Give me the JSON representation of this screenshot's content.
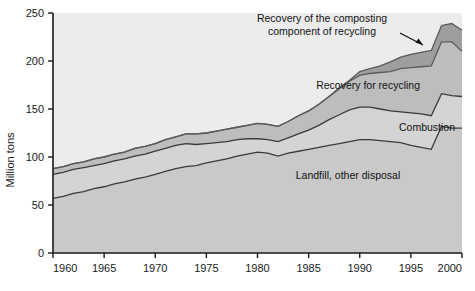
{
  "chart_data": {
    "type": "area",
    "title": "",
    "subtitle": "",
    "xlabel": "",
    "ylabel": "Million tons",
    "xlim": [
      1960,
      2000
    ],
    "ylim": [
      0,
      250
    ],
    "grid": false,
    "legend_position": "inline-annotations",
    "stacked": true,
    "x": [
      1960,
      1961,
      1962,
      1963,
      1964,
      1965,
      1966,
      1967,
      1968,
      1969,
      1970,
      1971,
      1972,
      1973,
      1974,
      1975,
      1976,
      1977,
      1978,
      1979,
      1980,
      1981,
      1982,
      1983,
      1984,
      1985,
      1986,
      1987,
      1988,
      1989,
      1990,
      1991,
      1992,
      1993,
      1994,
      1995,
      1996,
      1997,
      1998,
      1999,
      2000
    ],
    "xticks": [
      1960,
      1965,
      1970,
      1975,
      1980,
      1985,
      1990,
      1995,
      2000
    ],
    "xticklabels": [
      "1960",
      "1965",
      "1970",
      "1975",
      "1980",
      "1985",
      "1990",
      "1995",
      "2000"
    ],
    "yticks": [
      0,
      50,
      100,
      150,
      200,
      250
    ],
    "yticklabels": [
      "0",
      "50",
      "100",
      "150",
      "200",
      "250"
    ],
    "series": [
      {
        "name": "Landfill, other disposal",
        "color": "#c9c9c9",
        "line_color": "#3a3a3a",
        "values": [
          57,
          59,
          62,
          64,
          67,
          69,
          72,
          74,
          77,
          79,
          82,
          85,
          88,
          90,
          91,
          94,
          96,
          98,
          101,
          103,
          105,
          104,
          101,
          104,
          106,
          108,
          110,
          112,
          114,
          116,
          118,
          118,
          117,
          116,
          115,
          112,
          110,
          108,
          132,
          130,
          130
        ]
      },
      {
        "name": "Combustion",
        "color": "#d4d4d4",
        "line_color": "#3a3a3a",
        "values": [
          25,
          25,
          25,
          25,
          24,
          24,
          24,
          24,
          24,
          24,
          24,
          24,
          24,
          24,
          22,
          20,
          19,
          18,
          17,
          16,
          14,
          14,
          15,
          16,
          18,
          20,
          23,
          27,
          30,
          33,
          34,
          34,
          33,
          32,
          32,
          34,
          35,
          35,
          34,
          34,
          33
        ]
      },
      {
        "name": "Recovery for recycling",
        "color": "#bdbdbd",
        "line_color": "#5a5a5a",
        "values": [
          6,
          6,
          6,
          6,
          7,
          7,
          7,
          7,
          8,
          8,
          8,
          9,
          9,
          10,
          11,
          11,
          12,
          13,
          13,
          14,
          16,
          16,
          16,
          17,
          19,
          20,
          22,
          24,
          27,
          30,
          33,
          35,
          38,
          41,
          45,
          47,
          49,
          52,
          54,
          56,
          47
        ]
      },
      {
        "name": "Recovery of the composting component of recycling",
        "color": "#9e9e9e",
        "line_color": "#5a5a5a",
        "values": [
          0,
          0,
          0,
          0,
          0,
          0,
          0,
          0,
          0,
          0,
          0,
          0,
          0,
          0,
          0,
          0,
          0,
          0,
          0,
          0,
          0,
          0,
          0,
          0,
          0,
          0,
          0,
          0,
          1,
          1,
          4,
          5,
          7,
          10,
          12,
          14,
          15,
          16,
          17,
          19,
          22
        ]
      }
    ],
    "annotations": [
      {
        "id": "ann-composting",
        "line1": "Recovery of the composting",
        "line2": "component of recycling",
        "x": 322,
        "y": 22,
        "has_arrow": true
      },
      {
        "id": "ann-recycling",
        "text": "Recovery for recycling",
        "x": 420,
        "y": 89,
        "has_arrow": false
      },
      {
        "id": "ann-combustion",
        "text": "Combustion",
        "x": 455,
        "y": 131,
        "has_arrow": false
      },
      {
        "id": "ann-landfill",
        "text": "Landfill, other disposal",
        "x": 348,
        "y": 179,
        "has_arrow": false
      }
    ]
  },
  "colors": {
    "background": "#ffffff",
    "plot_background": "#ececec",
    "axis": "#1a1a1a",
    "band_landfill": "#c9c9c9",
    "band_combustion": "#d4d4d4",
    "band_recycling": "#bdbdbd",
    "band_composting": "#9e9e9e"
  }
}
